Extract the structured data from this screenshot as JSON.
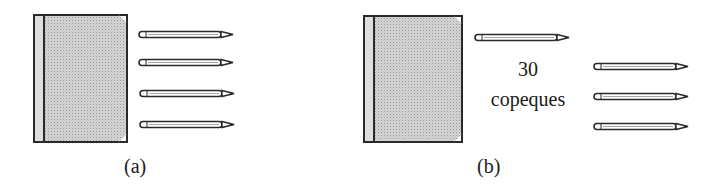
{
  "figure": {
    "panels": [
      {
        "label": "(a)",
        "items": {
          "book_count": 1,
          "pencil_count": 4
        }
      },
      {
        "label": "(b)",
        "items": {
          "book_count": 1,
          "pencil_count_top": 1,
          "pencil_count_right": 3
        },
        "annotation": {
          "amount": "30",
          "unit": "copeques"
        }
      }
    ],
    "colors": {
      "ink": "#2a2a2a",
      "book_fill": "#d4d4d4",
      "background": "#ffffff"
    }
  }
}
